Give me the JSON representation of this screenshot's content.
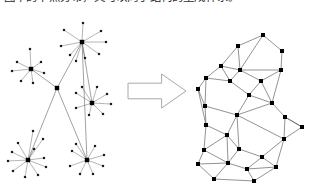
{
  "page": {
    "width": 314,
    "height": 183,
    "background": "#ffffff"
  },
  "caption": {
    "text": "图中的节点分布，又可以向子结构的生成体系。",
    "color": "#2b2b2b",
    "clipped": "true"
  },
  "figure": {
    "left_label": "star-graph",
    "right_label": "triangulated-mesh",
    "arrow_label": "transformation-arrow",
    "colors": {
      "edge": "#555555",
      "spoke": "#6a6a6a",
      "mesh_edge": "#4a4a4a",
      "node": "#000000",
      "arrow_stroke": "#a8a8a8",
      "arrow_fill": "#ffffff"
    }
  },
  "chart_data": {
    "type": "diagram",
    "panels": [
      {
        "name": "star-graph",
        "description": "Six hub nodes connected by a tree of backbone edges; each hub has radiating leaf spokes.",
        "hubs": [
          {
            "id": "h1",
            "x": 82,
            "y": 31,
            "degree": 9
          },
          {
            "id": "h2",
            "x": 31,
            "y": 58,
            "degree": 7
          },
          {
            "id": "h3",
            "x": 57,
            "y": 77,
            "degree": 4
          },
          {
            "id": "h4",
            "x": 92,
            "y": 92,
            "degree": 8
          },
          {
            "id": "h5",
            "x": 28,
            "y": 149,
            "degree": 11
          },
          {
            "id": "h6",
            "x": 87,
            "y": 149,
            "degree": 8
          }
        ],
        "backbone_edges": [
          [
            "h1",
            "h3"
          ],
          [
            "h1",
            "h4"
          ],
          [
            "h2",
            "h3"
          ],
          [
            "h3",
            "h5"
          ],
          [
            "h3",
            "h6"
          ],
          [
            "h1",
            "h6"
          ]
        ],
        "leaves": [
          {
            "hub": "h1",
            "x": 64,
            "y": 19
          },
          {
            "hub": "h1",
            "x": 83,
            "y": 12
          },
          {
            "hub": "h1",
            "x": 101,
            "y": 20
          },
          {
            "hub": "h1",
            "x": 106,
            "y": 31
          },
          {
            "hub": "h1",
            "x": 99,
            "y": 43
          },
          {
            "hub": "h1",
            "x": 85,
            "y": 47
          },
          {
            "hub": "h1",
            "x": 70,
            "y": 44
          },
          {
            "hub": "h1",
            "x": 61,
            "y": 35
          },
          {
            "hub": "h1",
            "x": 76,
            "y": 50
          },
          {
            "hub": "h2",
            "x": 17,
            "y": 51
          },
          {
            "hub": "h2",
            "x": 12,
            "y": 60
          },
          {
            "hub": "h2",
            "x": 21,
            "y": 70
          },
          {
            "hub": "h2",
            "x": 33,
            "y": 72
          },
          {
            "hub": "h2",
            "x": 44,
            "y": 62
          },
          {
            "hub": "h2",
            "x": 41,
            "y": 51
          },
          {
            "hub": "h2",
            "x": 30,
            "y": 38
          },
          {
            "hub": "h4",
            "x": 76,
            "y": 82
          },
          {
            "hub": "h4",
            "x": 82,
            "y": 76
          },
          {
            "hub": "h4",
            "x": 97,
            "y": 76
          },
          {
            "hub": "h4",
            "x": 107,
            "y": 83
          },
          {
            "hub": "h4",
            "x": 111,
            "y": 93
          },
          {
            "hub": "h4",
            "x": 103,
            "y": 103
          },
          {
            "hub": "h4",
            "x": 89,
            "y": 104
          },
          {
            "hub": "h4",
            "x": 76,
            "y": 97
          },
          {
            "hub": "h5",
            "x": 12,
            "y": 141
          },
          {
            "hub": "h5",
            "x": 8,
            "y": 150
          },
          {
            "hub": "h5",
            "x": 13,
            "y": 160
          },
          {
            "hub": "h5",
            "x": 25,
            "y": 166
          },
          {
            "hub": "h5",
            "x": 38,
            "y": 164
          },
          {
            "hub": "h5",
            "x": 46,
            "y": 156
          },
          {
            "hub": "h5",
            "x": 44,
            "y": 147
          },
          {
            "hub": "h5",
            "x": 34,
            "y": 138
          },
          {
            "hub": "h5",
            "x": 33,
            "y": 120
          },
          {
            "hub": "h5",
            "x": 43,
            "y": 128
          },
          {
            "hub": "h5",
            "x": 18,
            "y": 132
          },
          {
            "hub": "h6",
            "x": 72,
            "y": 140
          },
          {
            "hub": "h6",
            "x": 76,
            "y": 133
          },
          {
            "hub": "h6",
            "x": 95,
            "y": 135
          },
          {
            "hub": "h6",
            "x": 104,
            "y": 144
          },
          {
            "hub": "h6",
            "x": 103,
            "y": 155
          },
          {
            "hub": "h6",
            "x": 93,
            "y": 163
          },
          {
            "hub": "h6",
            "x": 80,
            "y": 163
          },
          {
            "hub": "h6",
            "x": 70,
            "y": 155
          }
        ]
      },
      {
        "name": "triangulated-mesh",
        "description": "Planar triangulated mesh of nodes with straight edges forming triangles and quads.",
        "nodes": [
          {
            "id": "m0",
            "x": 263,
            "y": 24
          },
          {
            "id": "m1",
            "x": 238,
            "y": 35
          },
          {
            "id": "m2",
            "x": 282,
            "y": 40
          },
          {
            "id": "m3",
            "x": 240,
            "y": 59
          },
          {
            "id": "m4",
            "x": 221,
            "y": 55
          },
          {
            "id": "m5",
            "x": 281,
            "y": 59
          },
          {
            "id": "m6",
            "x": 206,
            "y": 67
          },
          {
            "id": "m7",
            "x": 230,
            "y": 70
          },
          {
            "id": "m8",
            "x": 261,
            "y": 70
          },
          {
            "id": "m9",
            "x": 198,
            "y": 78
          },
          {
            "id": "m10",
            "x": 249,
            "y": 84
          },
          {
            "id": "m11",
            "x": 205,
            "y": 95
          },
          {
            "id": "m12",
            "x": 272,
            "y": 92
          },
          {
            "id": "m13",
            "x": 285,
            "y": 106
          },
          {
            "id": "m14",
            "x": 237,
            "y": 104
          },
          {
            "id": "m15",
            "x": 206,
            "y": 114
          },
          {
            "id": "m16",
            "x": 302,
            "y": 116
          },
          {
            "id": "m17",
            "x": 227,
            "y": 124
          },
          {
            "id": "m18",
            "x": 284,
            "y": 128
          },
          {
            "id": "m19",
            "x": 239,
            "y": 138
          },
          {
            "id": "m20",
            "x": 204,
            "y": 139
          },
          {
            "id": "m21",
            "x": 262,
            "y": 146
          },
          {
            "id": "m22",
            "x": 228,
            "y": 152
          },
          {
            "id": "m23",
            "x": 198,
            "y": 153
          },
          {
            "id": "m24",
            "x": 247,
            "y": 158
          },
          {
            "id": "m25",
            "x": 276,
            "y": 156
          },
          {
            "id": "m26",
            "x": 214,
            "y": 168
          },
          {
            "id": "m27",
            "x": 254,
            "y": 170
          }
        ],
        "edges": [
          [
            "m0",
            "m1"
          ],
          [
            "m0",
            "m2"
          ],
          [
            "m1",
            "m3"
          ],
          [
            "m1",
            "m4"
          ],
          [
            "m2",
            "m5"
          ],
          [
            "m0",
            "m3"
          ],
          [
            "m3",
            "m5"
          ],
          [
            "m3",
            "m4"
          ],
          [
            "m4",
            "m6"
          ],
          [
            "m4",
            "m7"
          ],
          [
            "m3",
            "m7"
          ],
          [
            "m3",
            "m8"
          ],
          [
            "m5",
            "m8"
          ],
          [
            "m6",
            "m7"
          ],
          [
            "m6",
            "m9"
          ],
          [
            "m7",
            "m10"
          ],
          [
            "m8",
            "m10"
          ],
          [
            "m8",
            "m12"
          ],
          [
            "m5",
            "m12"
          ],
          [
            "m9",
            "m11"
          ],
          [
            "m6",
            "m11"
          ],
          [
            "m10",
            "m12"
          ],
          [
            "m10",
            "m14"
          ],
          [
            "m12",
            "m13"
          ],
          [
            "m13",
            "m16"
          ],
          [
            "m12",
            "m14"
          ],
          [
            "m11",
            "m15"
          ],
          [
            "m11",
            "m14"
          ],
          [
            "m14",
            "m17"
          ],
          [
            "m13",
            "m18"
          ],
          [
            "m16",
            "m18"
          ],
          [
            "m14",
            "m18"
          ],
          [
            "m15",
            "m17"
          ],
          [
            "m15",
            "m20"
          ],
          [
            "m17",
            "m19"
          ],
          [
            "m17",
            "m20"
          ],
          [
            "m17",
            "m22"
          ],
          [
            "m18",
            "m21"
          ],
          [
            "m19",
            "m21"
          ],
          [
            "m14",
            "m19"
          ],
          [
            "m19",
            "m22"
          ],
          [
            "m20",
            "m23"
          ],
          [
            "m20",
            "m22"
          ],
          [
            "m21",
            "m25"
          ],
          [
            "m22",
            "m24"
          ],
          [
            "m21",
            "m24"
          ],
          [
            "m23",
            "m26"
          ],
          [
            "m22",
            "m26"
          ],
          [
            "m24",
            "m27"
          ],
          [
            "m25",
            "m27"
          ],
          [
            "m26",
            "m27"
          ],
          [
            "m23",
            "m22"
          ],
          [
            "m25",
            "m18"
          ],
          [
            "m24",
            "m25"
          ],
          [
            "m9",
            "m15"
          ],
          [
            "m16",
            "m13"
          ]
        ]
      }
    ],
    "arrow": {
      "direction": "right",
      "x": 128,
      "y": 63,
      "width": 58,
      "height": 34
    }
  }
}
